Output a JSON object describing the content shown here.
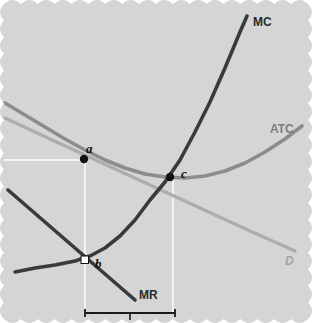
{
  "figure": {
    "background_color": "#d5d5d5",
    "paper_edge": "scalloped"
  },
  "curves": {
    "mc": {
      "label": "MC",
      "color": "#3a3a3a",
      "type": "marginal-cost"
    },
    "atc": {
      "label": "ATC",
      "color": "#8c8c8c",
      "type": "average-total-cost"
    },
    "demand": {
      "label": "D",
      "color": "#adadad",
      "type": "demand"
    },
    "mr": {
      "label": "MR",
      "color": "#3a3a3a",
      "type": "marginal-revenue"
    }
  },
  "points": [
    {
      "id": "a",
      "label": "a",
      "marker": "filled-dot",
      "x": 84,
      "y": 159,
      "on": "demand"
    },
    {
      "id": "b",
      "label": "b",
      "marker": "open-square",
      "x": 85,
      "y": 260,
      "on": "mr-mc-intersection"
    },
    {
      "id": "c",
      "label": "c",
      "marker": "filled-dot",
      "x": 170,
      "y": 177,
      "on": "mc-atc-intersection"
    }
  ],
  "guide_lines": {
    "color": "#ffffff",
    "price_line_label": "",
    "quantity_line_label": ""
  },
  "bracket": {
    "label": "",
    "x_start": 85,
    "x_end": 175,
    "y": 313
  },
  "chart_data": {
    "type": "line",
    "xlabel": "",
    "ylabel": "",
    "xlim": [
      0,
      312
    ],
    "ylim": [
      323,
      0
    ],
    "grid": false,
    "legend": "inline-curve-labels",
    "series": [
      {
        "name": "MC",
        "color": "#3a3a3a",
        "points": [
          [
            15,
            272
          ],
          [
            35,
            268
          ],
          [
            55,
            265
          ],
          [
            75,
            261
          ],
          [
            90,
            256
          ],
          [
            105,
            248
          ],
          [
            120,
            236
          ],
          [
            135,
            220
          ],
          [
            150,
            200
          ],
          [
            165,
            182
          ],
          [
            180,
            160
          ],
          [
            195,
            132
          ],
          [
            210,
            102
          ],
          [
            225,
            68
          ],
          [
            240,
            32
          ],
          [
            247,
            16
          ]
        ]
      },
      {
        "name": "ATC",
        "color": "#8c8c8c",
        "points": [
          [
            5,
            103
          ],
          [
            25,
            115
          ],
          [
            45,
            127
          ],
          [
            65,
            139
          ],
          [
            85,
            150
          ],
          [
            105,
            160
          ],
          [
            125,
            168
          ],
          [
            145,
            174
          ],
          [
            165,
            177
          ],
          [
            185,
            178
          ],
          [
            205,
            176
          ],
          [
            225,
            171
          ],
          [
            245,
            163
          ],
          [
            265,
            152
          ],
          [
            285,
            139
          ],
          [
            302,
            126
          ]
        ]
      },
      {
        "name": "D",
        "color": "#adadad",
        "points": [
          [
            5,
            118
          ],
          [
            50,
            139
          ],
          [
            100,
            162
          ],
          [
            150,
            185
          ],
          [
            200,
            208
          ],
          [
            250,
            231
          ],
          [
            295,
            251
          ]
        ]
      },
      {
        "name": "MR",
        "color": "#3a3a3a",
        "points": [
          [
            8,
            190
          ],
          [
            135,
            300
          ]
        ]
      }
    ],
    "annotations": [
      {
        "text": "MC",
        "x": 253,
        "y": 22
      },
      {
        "text": "ATC",
        "x": 272,
        "y": 129
      },
      {
        "text": "D",
        "x": 288,
        "y": 260
      },
      {
        "text": "MR",
        "x": 141,
        "y": 295
      },
      {
        "text": "a",
        "x": 88,
        "y": 152
      },
      {
        "text": "b",
        "x": 97,
        "y": 265
      },
      {
        "text": "c",
        "x": 183,
        "y": 175
      }
    ]
  }
}
